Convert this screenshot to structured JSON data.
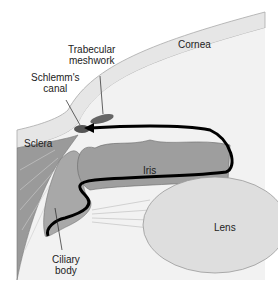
{
  "diagram": {
    "type": "anatomy",
    "labels": {
      "cornea": "Cornea",
      "trabecular": [
        "Trabecular",
        "meshwork"
      ],
      "schlemm": [
        "Schlemm's",
        "canal"
      ],
      "sclera": "Sclera",
      "iris": "Iris",
      "lens": "Lens",
      "ciliary": [
        "Ciliary",
        "body"
      ]
    },
    "colors": {
      "background": "#ffffff",
      "tissue_light": "#ececec",
      "tissue_mid": "#bdbdbd",
      "tissue_dark": "#8a8a8a",
      "flow_arrow": "#000000"
    }
  }
}
